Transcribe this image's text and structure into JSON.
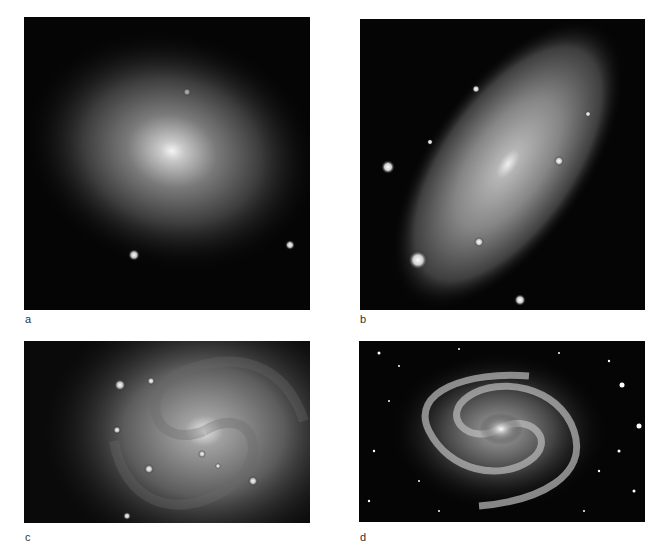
{
  "figure": {
    "panels": [
      {
        "id": "a",
        "label": "a",
        "subject": "elliptical-galaxy",
        "description": "Smooth elliptical galaxy with bright core, elongated horizontally"
      },
      {
        "id": "b",
        "label": "b",
        "subject": "lenticular-galaxy-inclined",
        "description": "Inclined disk galaxy elongated diagonally with foreground stars"
      },
      {
        "id": "c",
        "label": "c",
        "subject": "spiral-galaxy-closeup",
        "description": "Face-on spiral galaxy close-up with knotty arms"
      },
      {
        "id": "d",
        "label": "d",
        "subject": "barred-spiral-galaxy",
        "description": "Grand-design spiral galaxy with bright nucleus in star field"
      }
    ],
    "colors": {
      "background": "#ffffff",
      "sky": "#050505",
      "label": "#333333"
    }
  }
}
